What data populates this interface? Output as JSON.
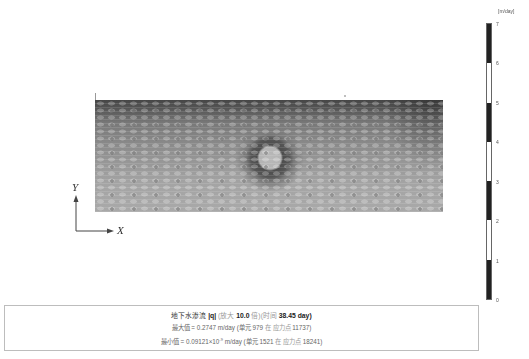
{
  "figure": {
    "plot": {
      "description": "Groundwater seepage magnitude contour field with a circular high-gradient region (dark ring, light core) near upper-middle of domain"
    },
    "axes": {
      "x_label": "X",
      "y_label": "Y"
    },
    "colorbar": {
      "unit": "[m/day]",
      "ticks": [
        "7",
        "6",
        "5",
        "4",
        "3",
        "2",
        "1",
        "0"
      ],
      "segments": [
        {
          "range": "7-6",
          "color": "#222222"
        },
        {
          "range": "6-5",
          "color": "#ffffff"
        },
        {
          "range": "5-4",
          "color": "#222222"
        },
        {
          "range": "4-3",
          "color": "#ffffff"
        },
        {
          "range": "3-2",
          "color": "#222222"
        },
        {
          "range": "2-1",
          "color": "#ffffff"
        },
        {
          "range": "1-0",
          "color": "#222222"
        }
      ]
    },
    "info": {
      "title_prefix": "地下水渗流",
      "title_quantity": "|q|",
      "title_scale_prefix": "(放大",
      "title_scale_value": "10.0",
      "title_scale_suffix": "倍)",
      "title_time_prefix": "(时间",
      "title_time_value": "38.45 day",
      "title_time_suffix": ")",
      "max_label": "最大值",
      "max_value": "= 0.2747 m/day",
      "max_element_prefix": "(单元",
      "max_element": "979",
      "max_at": "在",
      "max_point_label": "应力点",
      "max_point": "11737)",
      "min_label": "最小值",
      "min_value_mantissa": "= 0.09121×10",
      "min_value_exp": "-9",
      "min_value_unit": "m/day",
      "min_element_prefix": "(单元",
      "min_element": "1521",
      "min_at": "在",
      "min_point_label": "应力点",
      "min_point": "18241)"
    }
  }
}
